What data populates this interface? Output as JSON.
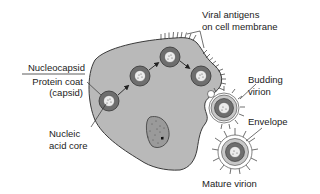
{
  "diagram": {
    "colors": {
      "cytoplasm": "#b9b9b9",
      "outline": "#3a3a3a",
      "capsid": "#6e6e6e",
      "core": "#ececec",
      "envelope": "#c8c8c8",
      "nucleus": "#9a9a9a",
      "text": "#222222"
    },
    "labels": {
      "nucleocapsid": "Nucleocapsid",
      "protein_coat_line1": "Protein coat",
      "protein_coat_line2": "(capsid)",
      "nucleic_acid_line1": "Nucleic",
      "nucleic_acid_line2": "acid core",
      "viral_antigens_line1": "Viral antigens",
      "viral_antigens_line2": "on cell membrane",
      "budding_line1": "Budding",
      "budding_line2": "virion",
      "envelope": "Envelope",
      "mature_virion": "Mature virion"
    },
    "components": [
      {
        "name": "host-cell",
        "label": "Host cell"
      },
      {
        "name": "nucleus",
        "label": "Nucleus"
      },
      {
        "name": "nucleocapsid-1"
      },
      {
        "name": "nucleocapsid-2"
      },
      {
        "name": "nucleocapsid-3"
      },
      {
        "name": "nucleocapsid-4"
      },
      {
        "name": "budding-virion"
      },
      {
        "name": "mature-virion"
      }
    ]
  }
}
